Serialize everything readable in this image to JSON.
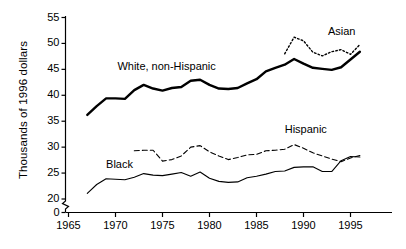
{
  "chart_data": {
    "type": "line",
    "title": "",
    "subtitle": "",
    "xlabel": "",
    "ylabel": "Thousands of 1996 dollars",
    "xlim": [
      1965,
      1997
    ],
    "ylim": [
      20,
      55
    ],
    "y_axis_break": true,
    "y_axis_break_note": "axis broken between 0 and 20",
    "grid": false,
    "legend_position": "inline-labels",
    "xticks": [
      "1965",
      "1970",
      "1975",
      "1980",
      "1985",
      "1990",
      "1995"
    ],
    "xtick_values": [
      1965,
      1970,
      1975,
      1980,
      1985,
      1990,
      1995
    ],
    "yticks": [
      "0",
      "20",
      "25",
      "30",
      "35",
      "40",
      "45",
      "50",
      "55"
    ],
    "ytick_values": [
      0,
      20,
      25,
      30,
      35,
      40,
      45,
      50,
      55
    ],
    "series": [
      {
        "name": "White, non-Hispanic",
        "style": "solid-thick",
        "color": "#000000",
        "label_x": 1970.2,
        "label_y": 45.4,
        "x": [
          1967,
          1968,
          1969,
          1970,
          1971,
          1972,
          1973,
          1974,
          1975,
          1976,
          1977,
          1978,
          1979,
          1980,
          1981,
          1982,
          1983,
          1984,
          1985,
          1986,
          1987,
          1988,
          1989,
          1990,
          1991,
          1992,
          1993,
          1994,
          1995,
          1996
        ],
        "values": [
          36.2,
          37.9,
          39.4,
          39.4,
          39.3,
          41.0,
          42.0,
          41.3,
          40.9,
          41.4,
          41.6,
          42.8,
          43.0,
          42.0,
          41.3,
          41.2,
          41.4,
          42.3,
          43.1,
          44.6,
          45.3,
          45.9,
          47.0,
          46.1,
          45.3,
          45.1,
          44.9,
          45.4,
          46.9,
          48.4
        ]
      },
      {
        "name": "Asian",
        "style": "dotted",
        "color": "#000000",
        "label_x": 1992.6,
        "label_y": 52.3,
        "x": [
          1988,
          1989,
          1990,
          1991,
          1992,
          1993,
          1994,
          1995,
          1996
        ],
        "values": [
          48.0,
          51.2,
          50.5,
          48.3,
          47.6,
          48.4,
          48.8,
          47.9,
          49.8
        ]
      },
      {
        "name": "Hispanic",
        "style": "dashed",
        "color": "#000000",
        "label_x": 1988.0,
        "label_y": 33.4,
        "x": [
          1972,
          1973,
          1974,
          1975,
          1976,
          1977,
          1978,
          1979,
          1980,
          1981,
          1982,
          1983,
          1984,
          1985,
          1986,
          1987,
          1988,
          1989,
          1990,
          1991,
          1992,
          1993,
          1994,
          1995,
          1996
        ],
        "values": [
          29.3,
          29.4,
          29.4,
          27.3,
          27.6,
          28.3,
          30.0,
          30.3,
          29.1,
          28.3,
          27.6,
          28.0,
          28.5,
          28.6,
          29.3,
          29.4,
          29.6,
          30.5,
          29.8,
          28.9,
          28.3,
          27.7,
          27.2,
          27.9,
          28.4
        ]
      },
      {
        "name": "Black",
        "style": "solid-thin",
        "color": "#000000",
        "label_x": 1969.0,
        "label_y": 26.6,
        "x": [
          1967,
          1968,
          1969,
          1970,
          1971,
          1972,
          1973,
          1974,
          1975,
          1976,
          1977,
          1978,
          1979,
          1980,
          1981,
          1982,
          1983,
          1984,
          1985,
          1986,
          1987,
          1988,
          1989,
          1990,
          1991,
          1992,
          1993,
          1994,
          1995,
          1996
        ],
        "values": [
          21.1,
          22.8,
          23.9,
          23.8,
          23.7,
          24.2,
          24.9,
          24.6,
          24.5,
          24.8,
          25.1,
          24.4,
          25.2,
          24.0,
          23.4,
          23.2,
          23.3,
          24.1,
          24.4,
          24.8,
          25.3,
          25.4,
          26.1,
          26.2,
          26.2,
          25.3,
          25.3,
          27.4,
          28.2,
          28.1
        ]
      }
    ]
  },
  "axes": {
    "ylabel": "Thousands of 1996 dollars"
  }
}
